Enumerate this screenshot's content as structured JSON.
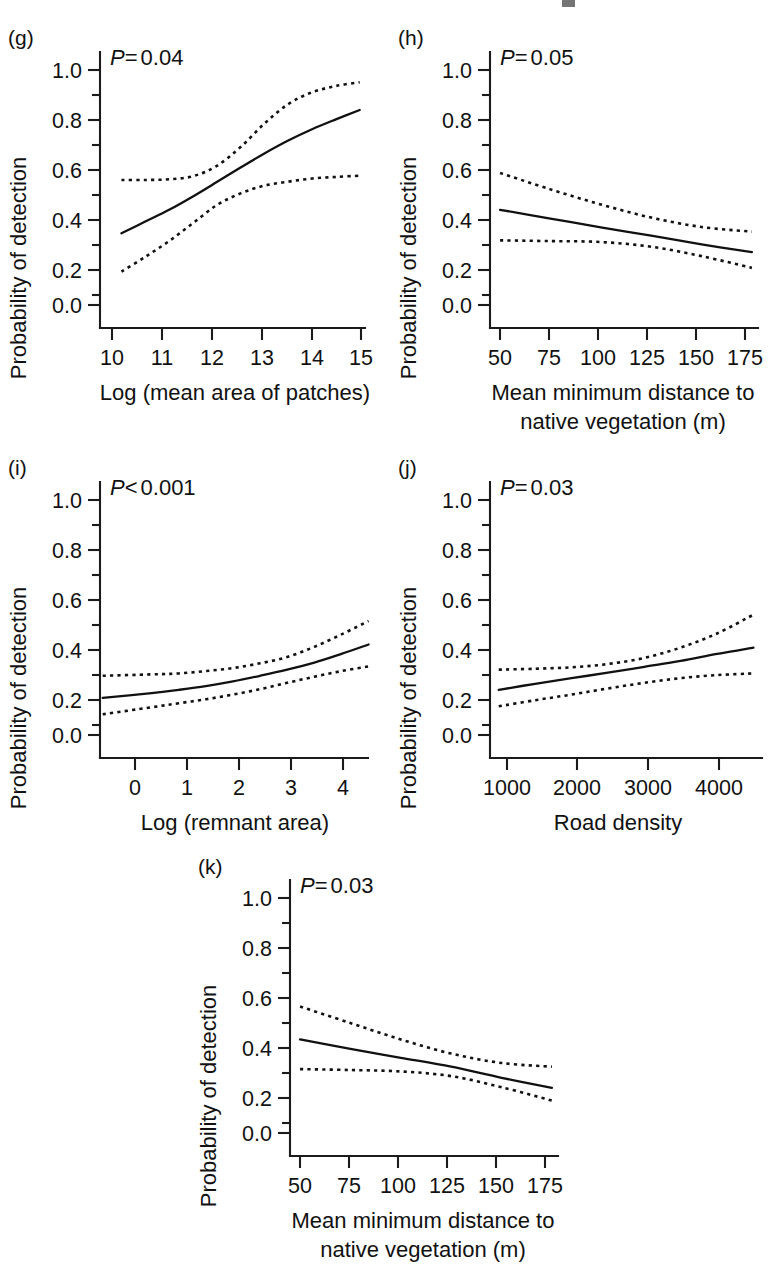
{
  "figure": {
    "ylabel": "Probability of detection",
    "panel_count": 5
  },
  "panels": {
    "g": {
      "letter": "(g)",
      "pvalue_symbol": "P",
      "pvalue_relation": "=",
      "pvalue_value": "0.04",
      "pvalue_text": "P= 0.04",
      "ylabel": "Probability of detection",
      "xlabel": "Log (mean area of patches)",
      "xlabel_line2": "",
      "yticks": [
        "0.0",
        "0.2",
        "0.4",
        "0.6",
        "0.8",
        "1.0"
      ],
      "xticks": [
        "10",
        "11",
        "12",
        "13",
        "14",
        "15"
      ]
    },
    "h": {
      "letter": "(h)",
      "pvalue_symbol": "P",
      "pvalue_relation": "=",
      "pvalue_value": "0.05",
      "pvalue_text": "P= 0.05",
      "ylabel": "Probability of detection",
      "xlabel": "Mean minimum distance to",
      "xlabel_line2": "native vegetation (m)",
      "yticks": [
        "0.0",
        "0.2",
        "0.4",
        "0.6",
        "0.8",
        "1.0"
      ],
      "xticks": [
        "50",
        "75",
        "100",
        "125",
        "150",
        "175"
      ]
    },
    "i": {
      "letter": "(i)",
      "pvalue_symbol": "P",
      "pvalue_relation": "<",
      "pvalue_value": "0.001",
      "pvalue_text": "P< 0.001",
      "ylabel": "Probability of detection",
      "xlabel": "Log (remnant area)",
      "xlabel_line2": "",
      "yticks": [
        "0.0",
        "0.2",
        "0.4",
        "0.6",
        "0.8",
        "1.0"
      ],
      "xticks": [
        "0",
        "1",
        "2",
        "3",
        "4"
      ]
    },
    "j": {
      "letter": "(j)",
      "pvalue_symbol": "P",
      "pvalue_relation": "=",
      "pvalue_value": "0.03",
      "pvalue_text": "P= 0.03",
      "ylabel": "Probability of detection",
      "xlabel": "Road density",
      "xlabel_line2": "",
      "yticks": [
        "0.0",
        "0.2",
        "0.4",
        "0.6",
        "0.8",
        "1.0"
      ],
      "xticks": [
        "1000",
        "2000",
        "3000",
        "4000"
      ]
    },
    "k": {
      "letter": "(k)",
      "pvalue_symbol": "P",
      "pvalue_relation": "=",
      "pvalue_value": "0.03",
      "pvalue_text": "P= 0.03",
      "ylabel": "Probability of detection",
      "xlabel": "Mean minimum distance to",
      "xlabel_line2": "native vegetation (m)",
      "yticks": [
        "0.0",
        "0.2",
        "0.4",
        "0.6",
        "0.8",
        "1.0"
      ],
      "xticks": [
        "50",
        "75",
        "100",
        "125",
        "150",
        "175"
      ]
    }
  },
  "chart_data": [
    {
      "id": "g",
      "type": "line",
      "title": "(g)",
      "xlabel": "Log (mean area of patches)",
      "ylabel": "Probability of detection",
      "xlim": [
        9.55,
        15.3
      ],
      "ylim": [
        0.0,
        1.0
      ],
      "xticks": [
        10,
        11,
        12,
        13,
        14,
        15
      ],
      "yticks": [
        0.0,
        0.2,
        0.4,
        0.6,
        0.8,
        1.0
      ],
      "yminorticks": [
        0.1,
        0.3,
        0.5,
        0.7,
        0.9
      ],
      "grid": false,
      "legend": "none",
      "annotation": "P= 0.04",
      "series": [
        {
          "name": "fitted",
          "style": "solid",
          "x": [
            10.0,
            10.5,
            11.0,
            11.5,
            12.0,
            12.5,
            13.0,
            13.5,
            14.0,
            14.5,
            15.0
          ],
          "values": [
            0.305,
            0.355,
            0.405,
            0.462,
            0.523,
            0.585,
            0.645,
            0.7,
            0.748,
            0.79,
            0.83
          ]
        },
        {
          "name": "upper-confidence",
          "style": "dashed",
          "x": [
            10.0,
            10.5,
            11.0,
            11.5,
            12.0,
            12.5,
            13.0,
            13.5,
            14.0,
            14.5,
            15.0
          ],
          "values": [
            0.532,
            0.532,
            0.535,
            0.548,
            0.592,
            0.672,
            0.772,
            0.855,
            0.905,
            0.932,
            0.948
          ]
        },
        {
          "name": "lower-confidence",
          "style": "dashed",
          "x": [
            10.0,
            10.5,
            11.0,
            11.5,
            12.0,
            12.5,
            13.0,
            13.5,
            14.0,
            14.5,
            15.0
          ],
          "values": [
            0.142,
            0.205,
            0.272,
            0.348,
            0.425,
            0.475,
            0.508,
            0.525,
            0.538,
            0.545,
            0.55
          ]
        }
      ]
    },
    {
      "id": "h",
      "type": "line",
      "title": "(h)",
      "xlabel": "Mean minimum distance to native vegetation (m)",
      "ylabel": "Probability of detection",
      "xlim": [
        45,
        182
      ],
      "ylim": [
        0.0,
        1.0
      ],
      "xticks": [
        50,
        75,
        100,
        125,
        150,
        175
      ],
      "yticks": [
        0.0,
        0.2,
        0.4,
        0.6,
        0.8,
        1.0
      ],
      "yminorticks": [
        0.1,
        0.3,
        0.5,
        0.7,
        0.9
      ],
      "grid": false,
      "legend": "none",
      "annotation": "P= 0.05",
      "series": [
        {
          "name": "fitted",
          "style": "solid",
          "x": [
            50,
            75,
            100,
            125,
            150,
            175
          ],
          "values": [
            0.405,
            0.368,
            0.33,
            0.295,
            0.258,
            0.225
          ]
        },
        {
          "name": "upper-confidence",
          "style": "dashed",
          "x": [
            50,
            75,
            100,
            125,
            150,
            175
          ],
          "values": [
            0.562,
            0.492,
            0.428,
            0.372,
            0.332,
            0.312
          ]
        },
        {
          "name": "lower-confidence",
          "style": "dashed",
          "x": [
            50,
            75,
            100,
            125,
            150,
            175
          ],
          "values": [
            0.275,
            0.272,
            0.268,
            0.248,
            0.208,
            0.158
          ]
        }
      ]
    },
    {
      "id": "i",
      "type": "line",
      "title": "(i)",
      "xlabel": "Log (remnant area)",
      "ylabel": "Probability of detection",
      "xlim": [
        -0.45,
        4.6
      ],
      "ylim": [
        0.0,
        1.0
      ],
      "xticks": [
        0,
        1,
        2,
        3,
        4
      ],
      "yticks": [
        0.0,
        0.2,
        0.4,
        0.6,
        0.8,
        1.0
      ],
      "yminorticks": [
        0.1,
        0.3,
        0.5,
        0.7,
        0.9
      ],
      "grid": false,
      "legend": "none",
      "annotation": "P< 0.001",
      "series": [
        {
          "name": "fitted",
          "style": "solid",
          "x": [
            -0.4,
            0.5,
            1.0,
            1.5,
            2.0,
            2.5,
            3.0,
            3.5,
            4.0,
            4.5
          ],
          "values": [
            0.158,
            0.178,
            0.192,
            0.208,
            0.228,
            0.252,
            0.278,
            0.308,
            0.345,
            0.385
          ]
        },
        {
          "name": "upper-confidence",
          "style": "dashed",
          "x": [
            -0.4,
            0.5,
            1.0,
            1.5,
            2.0,
            2.5,
            3.0,
            3.5,
            4.0,
            4.5
          ],
          "values": [
            0.252,
            0.258,
            0.262,
            0.272,
            0.285,
            0.305,
            0.332,
            0.375,
            0.428,
            0.485
          ]
        },
        {
          "name": "lower-confidence",
          "style": "dashed",
          "x": [
            -0.4,
            0.5,
            1.0,
            1.5,
            2.0,
            2.5,
            3.0,
            3.5,
            4.0,
            4.5
          ],
          "values": [
            0.088,
            0.118,
            0.135,
            0.152,
            0.172,
            0.195,
            0.222,
            0.248,
            0.272,
            0.292
          ]
        }
      ]
    },
    {
      "id": "j",
      "type": "line",
      "title": "(j)",
      "xlabel": "Road density",
      "ylabel": "Probability of detection",
      "xlim": [
        880,
        4700
      ],
      "ylim": [
        0.0,
        1.0
      ],
      "xticks": [
        1000,
        2000,
        3000,
        4000
      ],
      "yticks": [
        0.0,
        0.2,
        0.4,
        0.6,
        0.8,
        1.0
      ],
      "yminorticks": [
        0.1,
        0.3,
        0.5,
        0.7,
        0.9
      ],
      "grid": false,
      "legend": "none",
      "annotation": "P= 0.03",
      "series": [
        {
          "name": "fitted",
          "style": "solid",
          "x": [
            1000,
            1500,
            2000,
            2500,
            3000,
            3500,
            4000,
            4500
          ],
          "values": [
            0.192,
            0.218,
            0.242,
            0.265,
            0.29,
            0.315,
            0.345,
            0.372
          ]
        },
        {
          "name": "upper-confidence",
          "style": "dashed",
          "x": [
            1000,
            1500,
            2000,
            2500,
            3000,
            3500,
            4000,
            4500
          ],
          "values": [
            0.278,
            0.282,
            0.288,
            0.302,
            0.328,
            0.372,
            0.432,
            0.512
          ]
        },
        {
          "name": "lower-confidence",
          "style": "dashed",
          "x": [
            1000,
            1500,
            2000,
            2500,
            3000,
            3500,
            4000,
            4500
          ],
          "values": [
            0.122,
            0.148,
            0.172,
            0.198,
            0.222,
            0.242,
            0.255,
            0.262
          ]
        }
      ]
    },
    {
      "id": "k",
      "type": "line",
      "title": "(k)",
      "xlabel": "Mean minimum distance to native vegetation (m)",
      "ylabel": "Probability of detection",
      "xlim": [
        45,
        182
      ],
      "ylim": [
        0.0,
        1.0
      ],
      "xticks": [
        50,
        75,
        100,
        125,
        150,
        175
      ],
      "yticks": [
        0.0,
        0.2,
        0.4,
        0.6,
        0.8,
        1.0
      ],
      "yminorticks": [
        0.1,
        0.3,
        0.5,
        0.7,
        0.9
      ],
      "grid": false,
      "legend": "none",
      "annotation": "P= 0.03",
      "series": [
        {
          "name": "fitted",
          "style": "solid",
          "x": [
            50,
            75,
            100,
            125,
            150,
            175
          ],
          "values": [
            0.398,
            0.358,
            0.32,
            0.282,
            0.235,
            0.192
          ]
        },
        {
          "name": "upper-confidence",
          "style": "dashed",
          "x": [
            50,
            75,
            100,
            125,
            150,
            175
          ],
          "values": [
            0.538,
            0.468,
            0.398,
            0.338,
            0.298,
            0.282
          ]
        },
        {
          "name": "lower-confidence",
          "style": "dashed",
          "x": [
            50,
            75,
            100,
            125,
            150,
            175
          ],
          "values": [
            0.272,
            0.268,
            0.262,
            0.242,
            0.195,
            0.138
          ]
        }
      ]
    }
  ]
}
